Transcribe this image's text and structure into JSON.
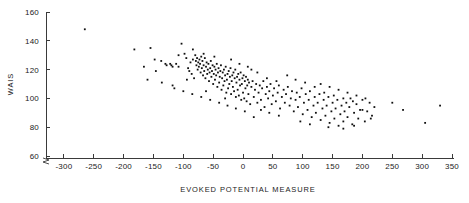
{
  "chart_data": {
    "type": "scatter",
    "title": "",
    "xlabel": "EVOKED POTENTIAL MEASURE",
    "ylabel": "WAIS",
    "xlim": [
      -330,
      350
    ],
    "ylim": [
      55,
      160
    ],
    "xticks": [
      -300,
      -250,
      -200,
      -150,
      -100,
      -50,
      0,
      50,
      100,
      150,
      200,
      250,
      300,
      350
    ],
    "yticks": [
      60,
      80,
      100,
      120,
      140,
      160
    ],
    "grid": false,
    "legend": null,
    "y_axis_break": true,
    "marker": "square",
    "marker_color": "#101010",
    "points": [
      [
        -265,
        148
      ],
      [
        -182,
        134
      ],
      [
        -155,
        135
      ],
      [
        -148,
        127
      ],
      [
        -137,
        126
      ],
      [
        -130,
        124
      ],
      [
        -128,
        123
      ],
      [
        -122,
        124
      ],
      [
        -120,
        123
      ],
      [
        -118,
        122
      ],
      [
        -112,
        124
      ],
      [
        -108,
        122
      ],
      [
        -160,
        113
      ],
      [
        -103,
        138
      ],
      [
        -98,
        131
      ],
      [
        -95,
        128
      ],
      [
        -92,
        121
      ],
      [
        -90,
        119
      ],
      [
        -88,
        125
      ],
      [
        -86,
        117
      ],
      [
        -84,
        127
      ],
      [
        -82,
        114
      ],
      [
        -80,
        130
      ],
      [
        -79,
        126
      ],
      [
        -78,
        123
      ],
      [
        -77,
        128
      ],
      [
        -76,
        120
      ],
      [
        -75,
        125
      ],
      [
        -74,
        122
      ],
      [
        -73,
        127
      ],
      [
        -72,
        124
      ],
      [
        -71,
        118
      ],
      [
        -70,
        129
      ],
      [
        -69,
        121
      ],
      [
        -68,
        126
      ],
      [
        -67,
        116
      ],
      [
        -66,
        123
      ],
      [
        -65,
        119
      ],
      [
        -64,
        128
      ],
      [
        -63,
        114
      ],
      [
        -62,
        122
      ],
      [
        -61,
        125
      ],
      [
        -60,
        117
      ],
      [
        -59,
        120
      ],
      [
        -58,
        124
      ],
      [
        -57,
        112
      ],
      [
        -56,
        118
      ],
      [
        -55,
        121
      ],
      [
        -54,
        126
      ],
      [
        -53,
        115
      ],
      [
        -52,
        119
      ],
      [
        -51,
        123
      ],
      [
        -50,
        110
      ],
      [
        -49,
        117
      ],
      [
        -48,
        122
      ],
      [
        -47,
        113
      ],
      [
        -46,
        120
      ],
      [
        -45,
        116
      ],
      [
        -44,
        124
      ],
      [
        -43,
        108
      ],
      [
        -42,
        118
      ],
      [
        -41,
        121
      ],
      [
        -40,
        111
      ],
      [
        -39,
        115
      ],
      [
        -38,
        119
      ],
      [
        -37,
        123
      ],
      [
        -36,
        106
      ],
      [
        -35,
        114
      ],
      [
        -34,
        118
      ],
      [
        -33,
        109
      ],
      [
        -32,
        120
      ],
      [
        -31,
        112
      ],
      [
        -30,
        116
      ],
      [
        -29,
        122
      ],
      [
        -28,
        104
      ],
      [
        -27,
        113
      ],
      [
        -26,
        117
      ],
      [
        -25,
        107
      ],
      [
        -24,
        119
      ],
      [
        -23,
        110
      ],
      [
        -22,
        115
      ],
      [
        -21,
        121
      ],
      [
        -20,
        103
      ],
      [
        -19,
        112
      ],
      [
        -18,
        116
      ],
      [
        -17,
        108
      ],
      [
        -16,
        118
      ],
      [
        -15,
        105
      ],
      [
        -14,
        114
      ],
      [
        -13,
        120
      ],
      [
        -12,
        101
      ],
      [
        -11,
        111
      ],
      [
        -10,
        115
      ],
      [
        -9,
        106
      ],
      [
        -8,
        117
      ],
      [
        -7,
        102
      ],
      [
        -6,
        113
      ],
      [
        -5,
        109
      ],
      [
        -4,
        118
      ],
      [
        -3,
        99
      ],
      [
        -2,
        110
      ],
      [
        -1,
        114
      ],
      [
        0,
        104
      ],
      [
        1,
        116
      ],
      [
        2,
        100
      ],
      [
        3,
        112
      ],
      [
        4,
        107
      ],
      [
        5,
        115
      ],
      [
        6,
        98
      ],
      [
        7,
        109
      ],
      [
        8,
        113
      ],
      [
        9,
        103
      ],
      [
        10,
        111
      ],
      [
        12,
        96
      ],
      [
        14,
        108
      ],
      [
        16,
        112
      ],
      [
        18,
        101
      ],
      [
        20,
        106
      ],
      [
        22,
        110
      ],
      [
        24,
        97
      ],
      [
        26,
        104
      ],
      [
        28,
        109
      ],
      [
        30,
        99
      ],
      [
        32,
        107
      ],
      [
        34,
        112
      ],
      [
        36,
        94
      ],
      [
        38,
        103
      ],
      [
        40,
        108
      ],
      [
        42,
        100
      ],
      [
        44,
        105
      ],
      [
        46,
        110
      ],
      [
        48,
        96
      ],
      [
        50,
        102
      ],
      [
        52,
        107
      ],
      [
        55,
        98
      ],
      [
        58,
        104
      ],
      [
        60,
        109
      ],
      [
        62,
        93
      ],
      [
        65,
        101
      ],
      [
        68,
        106
      ],
      [
        70,
        97
      ],
      [
        72,
        103
      ],
      [
        75,
        108
      ],
      [
        78,
        95
      ],
      [
        80,
        100
      ],
      [
        82,
        105
      ],
      [
        85,
        91
      ],
      [
        88,
        99
      ],
      [
        90,
        104
      ],
      [
        92,
        94
      ],
      [
        95,
        101
      ],
      [
        98,
        107
      ],
      [
        100,
        89
      ],
      [
        102,
        97
      ],
      [
        105,
        103
      ],
      [
        108,
        92
      ],
      [
        110,
        99
      ],
      [
        112,
        105
      ],
      [
        115,
        87
      ],
      [
        118,
        95
      ],
      [
        120,
        101
      ],
      [
        122,
        90
      ],
      [
        125,
        97
      ],
      [
        128,
        103
      ],
      [
        130,
        85
      ],
      [
        133,
        93
      ],
      [
        135,
        99
      ],
      [
        138,
        88
      ],
      [
        140,
        95
      ],
      [
        143,
        101
      ],
      [
        145,
        83
      ],
      [
        148,
        91
      ],
      [
        150,
        97
      ],
      [
        153,
        86
      ],
      [
        155,
        93
      ],
      [
        158,
        99
      ],
      [
        160,
        81
      ],
      [
        163,
        89
      ],
      [
        165,
        95
      ],
      [
        168,
        84
      ],
      [
        170,
        91
      ],
      [
        173,
        97
      ],
      [
        175,
        87
      ],
      [
        178,
        94
      ],
      [
        180,
        100
      ],
      [
        183,
        82
      ],
      [
        186,
        90
      ],
      [
        190,
        96
      ],
      [
        193,
        86
      ],
      [
        196,
        92
      ],
      [
        200,
        99
      ],
      [
        204,
        84
      ],
      [
        208,
        91
      ],
      [
        212,
        97
      ],
      [
        216,
        88
      ],
      [
        220,
        94
      ],
      [
        130,
        110
      ],
      [
        145,
        108
      ],
      [
        160,
        106
      ],
      [
        175,
        104
      ],
      [
        190,
        102
      ],
      [
        205,
        100
      ],
      [
        96,
        84
      ],
      [
        112,
        82
      ],
      [
        143,
        80
      ],
      [
        168,
        79
      ],
      [
        186,
        81
      ],
      [
        60,
        88
      ],
      [
        44,
        90
      ],
      [
        30,
        92
      ],
      [
        18,
        87
      ],
      [
        3,
        91
      ],
      [
        -12,
        93
      ],
      [
        -26,
        95
      ],
      [
        -40,
        97
      ],
      [
        -55,
        99
      ],
      [
        -70,
        101
      ],
      [
        -85,
        103
      ],
      [
        -100,
        105
      ],
      [
        -115,
        107
      ],
      [
        -136,
        111
      ],
      [
        -118,
        109
      ],
      [
        250,
        97
      ],
      [
        268,
        92
      ],
      [
        305,
        83
      ],
      [
        330,
        95
      ],
      [
        -94,
        113
      ],
      [
        -62,
        105
      ],
      [
        -30,
        100
      ],
      [
        8,
        122
      ],
      [
        24,
        118
      ],
      [
        40,
        114
      ],
      [
        56,
        112
      ],
      [
        74,
        116
      ],
      [
        88,
        113
      ],
      [
        104,
        111
      ],
      [
        120,
        108
      ],
      [
        136,
        104
      ],
      [
        152,
        102
      ],
      [
        168,
        100
      ],
      [
        184,
        98
      ],
      [
        200,
        92
      ],
      [
        214,
        86
      ],
      [
        -146,
        119
      ],
      [
        -108,
        130
      ],
      [
        -84,
        134
      ],
      [
        -66,
        131
      ],
      [
        -48,
        129
      ],
      [
        -20,
        127
      ],
      [
        -6,
        124
      ],
      [
        14,
        120
      ],
      [
        -166,
        122
      ]
    ]
  }
}
